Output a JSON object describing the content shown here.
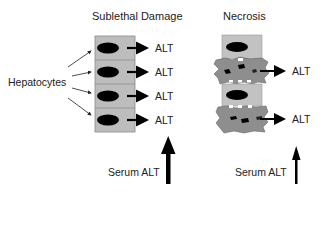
{
  "titles": {
    "left": "Sublethal Damage",
    "right": "Necrosis"
  },
  "side_label": "Hepatocytes",
  "cell_release_label": "ALT",
  "left_column": {
    "cells": [
      {
        "state": "intact",
        "release": "ALT"
      },
      {
        "state": "intact",
        "release": "ALT"
      },
      {
        "state": "intact",
        "release": "ALT"
      },
      {
        "state": "intact",
        "release": "ALT"
      }
    ]
  },
  "right_column": {
    "cells": [
      {
        "state": "intact",
        "release": ""
      },
      {
        "state": "necrotic",
        "release": "ALT"
      },
      {
        "state": "intact",
        "release": ""
      },
      {
        "state": "necrotic",
        "release": "ALT"
      }
    ]
  },
  "serum": {
    "left_label": "Serum ALT",
    "right_label": "Serum ALT",
    "left_arrow_size": "large",
    "right_arrow_size": "small"
  },
  "colors": {
    "cell_fill": "#bdbdbd",
    "cell_border": "#8a8a8a",
    "nucleus": "#000000",
    "necrotic_fill": "#8e8e8e",
    "arrow": "#000000"
  }
}
